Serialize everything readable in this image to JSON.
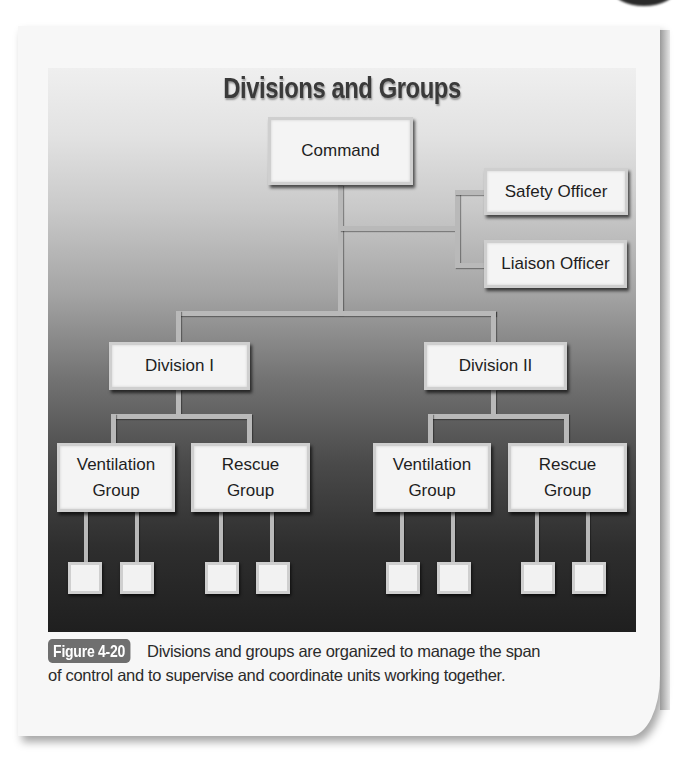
{
  "figure": {
    "title": "Divisions and Groups",
    "caption": {
      "label": "Figure 4-20",
      "text_line1": "Divisions and groups are organized to manage the span",
      "text_line2": "of control and to supervise and coordinate units working together."
    }
  },
  "chart": {
    "command": "Command",
    "staff": [
      "Safety Officer",
      "Liaison Officer"
    ],
    "divisions": [
      {
        "label": "Division I",
        "groups": [
          {
            "line1": "Ventilation",
            "line2": "Group",
            "units": 2
          },
          {
            "line1": "Rescue",
            "line2": "Group",
            "units": 2
          }
        ]
      },
      {
        "label": "Division II",
        "groups": [
          {
            "line1": "Ventilation",
            "line2": "Group",
            "units": 2
          },
          {
            "line1": "Rescue",
            "line2": "Group",
            "units": 2
          }
        ]
      }
    ]
  },
  "colors": {
    "panel_top": "#efefef",
    "panel_bottom": "#1f1f1f",
    "box_fill": "#f4f4f4",
    "connector": "#b9b9b9",
    "badge_bg": "#6f6f6f"
  }
}
